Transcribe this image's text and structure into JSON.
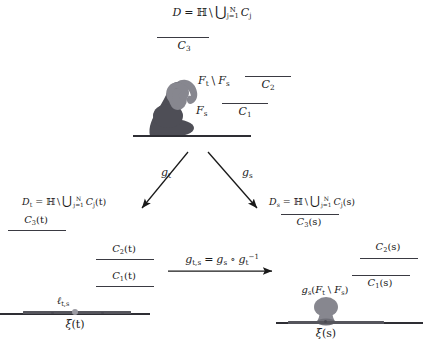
{
  "figure": {
    "type": "commutative-diagram"
  },
  "top": {
    "domain_label": "D = ℍ \\ ⋃_{j=1}^{N} C_j",
    "domain_D": "D",
    "equals": "=",
    "halfplane": "ℍ",
    "setminus": "\\",
    "union": "⋃",
    "union_sub": "j=1",
    "union_sup": "N",
    "C_j": "C",
    "C_j_sub": "j",
    "C3": "C",
    "C3_sub": "3",
    "C2": "C",
    "C2_sub": "2",
    "C1": "C",
    "C1_sub": "1",
    "hull_outer": "F",
    "hull_outer_sub": "t",
    "hull_outer_sep": "\\",
    "hull_outer_2": "F",
    "hull_outer_2_sub": "s",
    "hull_inner": "F",
    "hull_inner_sub": "s"
  },
  "arrows": {
    "left_label": "g",
    "left_label_sub": "t",
    "right_label": "g",
    "right_label_sub": "s",
    "center_label": "g",
    "center_label_sub": "t,s",
    "center_eq": "=",
    "center_gs": "g",
    "center_gs_sub": "s",
    "center_circ": "∘",
    "center_gt": "g",
    "center_gt_sub": "t",
    "center_gt_sup": "−1"
  },
  "left_panel": {
    "domain_label": "D_t = ℍ \\ ⋃_{j=1}^{N} C_j(t)",
    "D": "D",
    "D_sub": "t",
    "equals": "=",
    "halfplane": "ℍ",
    "setminus": "\\",
    "union": "⋃",
    "union_sub": "j=1",
    "union_sup": "N",
    "C": "C",
    "C_sub": "j",
    "C_arg": "(t)",
    "C3": "C",
    "C3_sub": "3",
    "C3_arg": "(t)",
    "C2": "C",
    "C2_sub": "2",
    "C2_arg": "(t)",
    "C1": "C",
    "C1_sub": "1",
    "C1_arg": "(t)",
    "ell": "ℓ",
    "ell_sub": "t,s",
    "xi": "ξ",
    "xi_arg": "(t)"
  },
  "right_panel": {
    "domain_label": "D_s = ℍ \\ ⋃_{j=1}^{N} C_j(s)",
    "D": "D",
    "D_sub": "s",
    "equals": "=",
    "halfplane": "ℍ",
    "setminus": "\\",
    "union": "⋃",
    "union_sub": "j=1",
    "union_sup": "N",
    "C": "C",
    "C_sub": "j",
    "C_arg": "(s)",
    "C3": "C",
    "C3_sub": "3",
    "C3_arg": "(s)",
    "C2": "C",
    "C2_sub": "2",
    "C2_arg": "(s)",
    "C1": "C",
    "C1_sub": "1",
    "C1_arg": "(s)",
    "image_label_g": "g",
    "image_label_g_sub": "s",
    "image_label_open": "(",
    "image_label_Ft": "F",
    "image_label_Ft_sub": "t",
    "image_label_sep": "\\",
    "image_label_Fs": "F",
    "image_label_Fs_sub": "s",
    "image_label_close": ")",
    "xi": "ξ",
    "xi_arg": "(s)"
  },
  "colors": {
    "ink": "#1a1a1a",
    "rule": "#3a3a42",
    "baseline": "#2e2e34",
    "hull_dark": "#4e4e56",
    "hull_light": "#87878f",
    "segment": "#55555c",
    "node_gray": "#9a9aa2"
  }
}
